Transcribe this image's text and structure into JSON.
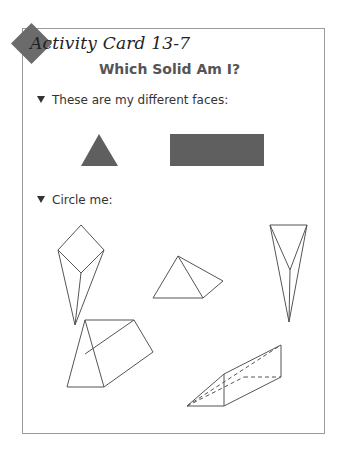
{
  "card": {
    "title": "Activity Card 13-7",
    "heading": "Which Solid Am I?"
  },
  "prompts": [
    {
      "label": "These are my different faces:"
    },
    {
      "label": "Circle me:"
    }
  ],
  "faces": [
    {
      "shape": "triangle",
      "color": "#5f5f5f"
    },
    {
      "shape": "rectangle",
      "color": "#5f5f5f"
    }
  ],
  "solids": [
    {
      "id": "square-pyramid-elongated"
    },
    {
      "id": "triangular-pyramid"
    },
    {
      "id": "triangular-pyramid-elongated"
    },
    {
      "id": "triangular-prism"
    },
    {
      "id": "triangular-prism-dashed"
    }
  ]
}
